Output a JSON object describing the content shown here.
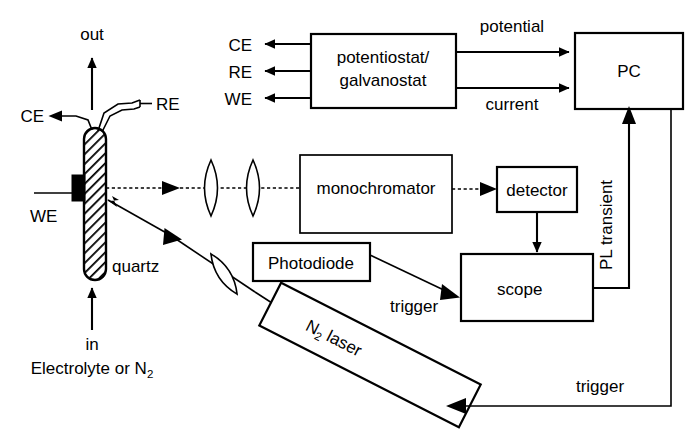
{
  "figure": {
    "type": "schematic-diagram",
    "background_color": "#ffffff",
    "line_color": "#000000"
  },
  "cell": {
    "material_label": "quartz",
    "gas_out_label": "out",
    "gas_in_label": "in",
    "inlet_medium_label": "Electrolyte or N",
    "inlet_medium_subscript": "2",
    "counter_electrode_label": "CE",
    "reference_electrode_label": "RE",
    "working_electrode_label": "WE"
  },
  "potentiostat": {
    "line1": "potentiostat/",
    "line2": "galvanostat",
    "outputs": [
      {
        "label": "CE"
      },
      {
        "label": "RE"
      },
      {
        "label": "WE"
      }
    ],
    "signals": [
      {
        "label": "potential"
      },
      {
        "label": "current"
      }
    ]
  },
  "pc": {
    "label": "PC"
  },
  "optics": {
    "monochromator_label": "monochromator",
    "detector_label": "detector",
    "photodiode_label": "Photodiode",
    "scope_label": "scope",
    "lens_count": 3
  },
  "laser": {
    "label": "N",
    "subscript": "2",
    "label_tail": " laser"
  },
  "signal_lines": {
    "pl_transient_label": "PL transient",
    "photodiode_trigger_label": "trigger",
    "pc_trigger_label": "trigger"
  }
}
